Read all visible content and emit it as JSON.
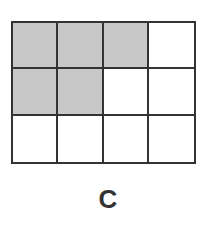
{
  "diagram": {
    "rows": 3,
    "cols": 4,
    "shaded_cells": [
      [
        0,
        0
      ],
      [
        0,
        1
      ],
      [
        0,
        2
      ],
      [
        1,
        0
      ],
      [
        1,
        1
      ]
    ],
    "shaded_count": 5,
    "total_cells": 12,
    "colors": {
      "shaded": "#c8c8c8",
      "empty": "#ffffff",
      "line": "#333333"
    },
    "label": "C"
  }
}
